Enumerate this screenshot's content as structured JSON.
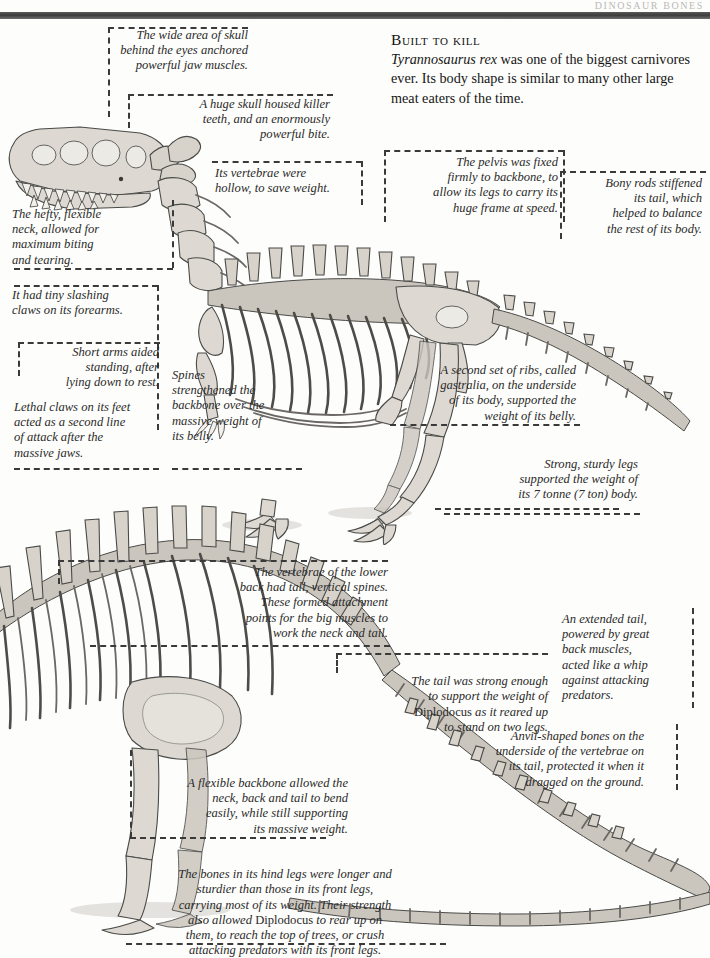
{
  "page": {
    "header_title": "DINOSAUR BONES",
    "background_color": "#fdfdfb",
    "rule_color": "#4a4a4a",
    "callout_border_color": "#3a3a3a"
  },
  "intro": {
    "heading": "Built to kill",
    "species": "Tyrannosaurus rex",
    "body_rest": " was one of the biggest carnivores ever. Its body shape is similar to many other large meat eaters of the time."
  },
  "rex": {
    "figure_name": "tyrannosaurus-rex-skeleton",
    "callouts": [
      {
        "id": "skull-width",
        "text": "The wide area of skull\nbehind the eyes anchored\npowerful jaw muscles.",
        "align": "right"
      },
      {
        "id": "huge-skull",
        "text": "A huge skull housed killer\nteeth, and an enormously\npowerful bite.",
        "align": "right"
      },
      {
        "id": "vertebrae",
        "text": "Its vertebrae were\nhollow, to save weight.",
        "align": "left"
      },
      {
        "id": "pelvis",
        "text": "The pelvis was fixed\nfirmly to backbone, to\nallow its legs to carry its\nhuge frame at speed.",
        "align": "right"
      },
      {
        "id": "bony-rods",
        "text": "Bony rods stiffened\nits tail, which\nhelped to balance\nthe rest of its body.",
        "align": "right"
      },
      {
        "id": "neck",
        "text": "The hefty, flexible\nneck, allowed for\nmaximum biting\nand tearing.",
        "align": "left"
      },
      {
        "id": "forearm-claws",
        "text": "It had tiny slashing\nclaws on its forearms.",
        "align": "left"
      },
      {
        "id": "short-arms",
        "text": "Short arms aided\nstanding, after\nlying down to rest.",
        "align": "right"
      },
      {
        "id": "foot-claws",
        "text": "Lethal claws on its feet\nacted as a second line\nof attack after the\nmassive jaws.",
        "align": "left"
      },
      {
        "id": "spines",
        "text": "Spines\nstrengthened the\nbackbone over the\nmassive weight of\nits belly.",
        "align": "left"
      },
      {
        "id": "gastralia",
        "text": "A second set of ribs, called\ngastralia, on the underside\nof its body, supported the\nweight of its belly.",
        "align": "right"
      },
      {
        "id": "legs",
        "text": "Strong, sturdy legs\nsupported the weight of\nits 7 tonne (7 ton) body.",
        "align": "right"
      }
    ]
  },
  "diplodocus": {
    "figure_name": "diplodocus-skeleton",
    "species": "Diplodocus",
    "callouts": [
      {
        "id": "lower-back-vertebrae",
        "text": "The vertebrae of the lower\nback had tall, vertical spines.\nThese formed attachment\npoints for the big muscles to\nwork the neck and tail.",
        "align": "right"
      },
      {
        "id": "tail-strength-pre",
        "text": "The tail was strong enough\nto support the weight of\n",
        "text_roman": "Diplodocus",
        "text_post": " as it reared up\nto stand on two legs.",
        "align": "right"
      },
      {
        "id": "extended-tail",
        "text": "An extended tail,\npowered by great\nback muscles,\nacted like a whip\nagainst attacking\npredators.",
        "align": "left"
      },
      {
        "id": "anvil-bones",
        "text": "Anvil-shaped bones on the\nunderside of the vertebrae on\nits tail, protected it when it\ndragged on the ground.",
        "align": "right"
      },
      {
        "id": "flexible-backbone",
        "text": "A flexible backbone allowed the\nneck, back and tail to bend\neasily, while still supporting\nits massive weight.",
        "align": "right"
      },
      {
        "id": "hind-legs-pre",
        "text": "The bones in its hind legs were longer and\nsturdier than those in its front legs,\ncarrying most of its weight. Their strength\nalso allowed ",
        "text_roman": "Diplodocus",
        "text_post": " to rear up on\nthem, to reach the top of trees, or crush\nattacking predators with its front legs.",
        "align": "center"
      }
    ]
  }
}
